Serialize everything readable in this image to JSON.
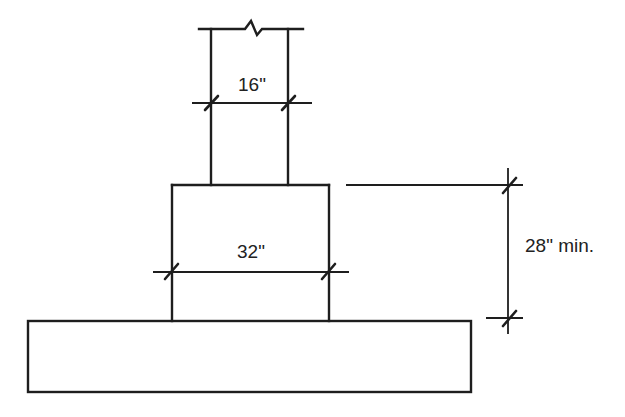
{
  "diagram": {
    "type": "footing-elevation",
    "colors": {
      "line": "#1e1e1e",
      "text": "#222222",
      "background": "#ffffff"
    },
    "elements": {
      "column": {
        "label": "column",
        "width_label": "16\""
      },
      "pier": {
        "label": "pier",
        "width_label": "32\""
      },
      "footing": {
        "label": "footing"
      },
      "height_dimension": {
        "label": "28\" min."
      },
      "break_line": {
        "label": "break-line"
      }
    }
  },
  "labels": {
    "column_width": "16\"",
    "pier_width": "32\"",
    "pier_height": "28\" min."
  }
}
